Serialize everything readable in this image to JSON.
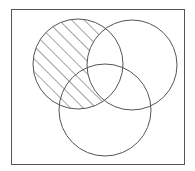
{
  "diagram": {
    "type": "venn",
    "sets": [
      {
        "name": "A",
        "position": "top-left",
        "cx": 78,
        "cy": 64,
        "r": 45
      },
      {
        "name": "B",
        "position": "top-right",
        "cx": 132,
        "cy": 65,
        "r": 45
      },
      {
        "name": "C",
        "position": "bottom",
        "cx": 105,
        "cy": 110,
        "r": 46
      }
    ],
    "shaded_region": "A minus B (A ∩ B′)",
    "shading_style": "diagonal-hatch",
    "stroke_color": "#555555",
    "background": "#ffffff"
  }
}
